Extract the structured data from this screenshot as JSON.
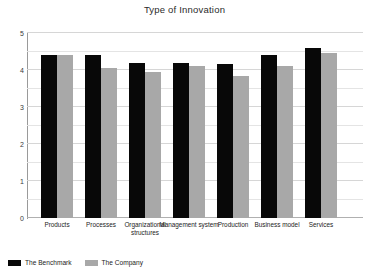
{
  "chart_data": {
    "type": "bar",
    "title": "Type of Innovation",
    "xlabel": "",
    "ylabel": "",
    "ylim": [
      0,
      5
    ],
    "yticks": [
      "0",
      "1",
      "2",
      "3",
      "4",
      "5"
    ],
    "grid": true,
    "minor_gridlines": true,
    "legend_position": "bottom-left",
    "categories": [
      "Products",
      "Processes",
      "Organizational structures",
      "Management system",
      "Production",
      "Business model",
      "Services"
    ],
    "series": [
      {
        "name": "The Benchmark",
        "color": "#080808",
        "values": [
          4.4,
          4.4,
          4.2,
          4.2,
          4.15,
          4.4,
          4.6
        ]
      },
      {
        "name": "The Company",
        "color": "#a8a8a8",
        "values": [
          4.4,
          4.05,
          3.95,
          4.1,
          3.85,
          4.1,
          4.45
        ]
      }
    ]
  },
  "legend": {
    "items": [
      {
        "label": "The Benchmark",
        "swatch": "benchmark"
      },
      {
        "label": "The Company",
        "swatch": "company"
      }
    ]
  }
}
